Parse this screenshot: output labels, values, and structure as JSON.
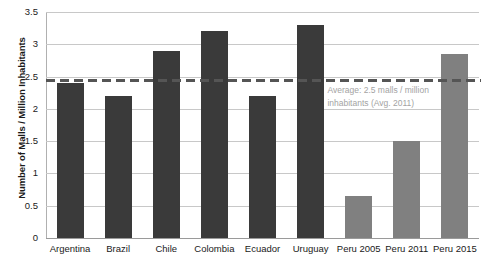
{
  "chart_data": {
    "type": "bar",
    "title": "",
    "xlabel": "",
    "ylabel": "Number of Malls / Million Inhabitants",
    "ylim": [
      0,
      3.5
    ],
    "ytick_labels": [
      "0",
      "0.5",
      "1",
      "1.5",
      "2",
      "2.5",
      "3",
      "3.5"
    ],
    "ytick_values": [
      0,
      0.5,
      1,
      1.5,
      2,
      2.5,
      3,
      3.5
    ],
    "grid": true,
    "legend": "none",
    "categories": [
      "Argentina",
      "Brazil",
      "Chile",
      "Colombia",
      "Ecuador",
      "Uruguay",
      "Peru 2005",
      "Peru 2011",
      "Peru 2015"
    ],
    "values": [
      2.4,
      2.2,
      2.9,
      3.2,
      2.2,
      3.3,
      0.65,
      1.5,
      2.85
    ],
    "bar_colors": [
      "#3a3a3a",
      "#3a3a3a",
      "#3a3a3a",
      "#3a3a3a",
      "#3a3a3a",
      "#3a3a3a",
      "#808080",
      "#808080",
      "#808080"
    ],
    "reference_line": {
      "value": 2.45,
      "style": "dashed",
      "color": "#555555",
      "label": "Average: 2.5 malls / million inhabitants (Avg. 2011)"
    }
  },
  "colors": {
    "bar_dark": "#3a3a3a",
    "bar_light": "#808080",
    "gridline": "#c8c8c8",
    "axis": "#9a9a9a",
    "annotation_text": "#a3a3a3",
    "text": "#1a1a1a"
  }
}
